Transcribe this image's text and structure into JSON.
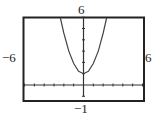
{
  "chart_data": {
    "type": "line",
    "title": "",
    "xlabel": "",
    "ylabel": "",
    "xlim": [
      -6,
      6
    ],
    "ylim": [
      -1,
      6
    ],
    "window_labels": {
      "xmin": "−6",
      "xmax": "6",
      "ymin": "−1",
      "ymax": "6"
    },
    "grid": false,
    "axis_ticks": {
      "x_step": 1,
      "y_step": 1
    },
    "series": [
      {
        "name": "curve",
        "description": "upward-opening parabola, vertex near (0, 1), exits top of window near x = ±2.35",
        "x": [
          -2.35,
          -2,
          -1.5,
          -1,
          -0.5,
          0,
          0.5,
          1,
          1.5,
          2,
          2.35
        ],
        "y": [
          6.0,
          4.6,
          3.0,
          1.9,
          1.2,
          1.0,
          1.2,
          1.9,
          3.0,
          4.6,
          6.0
        ]
      }
    ],
    "colors": {
      "frame": "#222222",
      "curve": "#444444"
    }
  }
}
